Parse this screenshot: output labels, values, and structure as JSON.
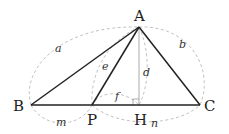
{
  "diagram": {
    "type": "triangle-geometry",
    "points": {
      "A": {
        "label": "A",
        "x": 139,
        "y": 27
      },
      "B": {
        "label": "B",
        "x": 31,
        "y": 105
      },
      "C": {
        "label": "C",
        "x": 200,
        "y": 105
      },
      "P": {
        "label": "P",
        "x": 92,
        "y": 105
      },
      "H": {
        "label": "H",
        "x": 139,
        "y": 105
      }
    },
    "segment_labels": {
      "a": "a",
      "b": "b",
      "e": "e",
      "d": "d",
      "f": "f",
      "m": "m",
      "n": "n"
    },
    "colors": {
      "line": "#222222",
      "altitude": "#aaaaaa",
      "dashed": "#bbbbbb"
    }
  }
}
